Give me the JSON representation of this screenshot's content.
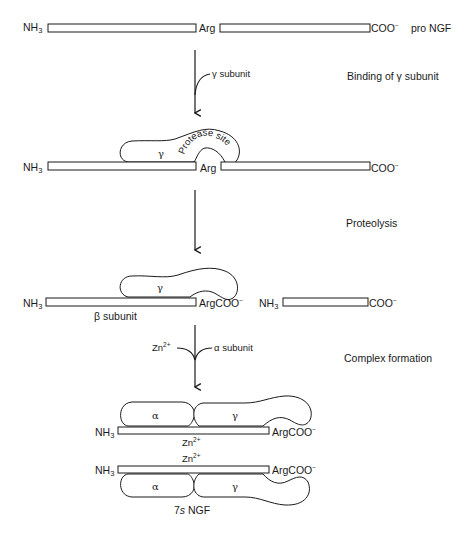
{
  "figure": {
    "stages": [
      {
        "id": "pro-ngf",
        "n_terminus": "NH3",
        "middle_label": "Arg",
        "c_terminus": "COO⁻",
        "name": "pro NGF"
      },
      {
        "id": "gamma-bound",
        "n_terminus": "NH3",
        "middle_label": "Arg",
        "c_terminus": "COO⁻",
        "gamma_label": "γ",
        "protease_label": "Protease site"
      },
      {
        "id": "cleaved",
        "left": {
          "n_terminus": "NH3",
          "c_terminus": "ArgCOO⁻",
          "name": "β subunit",
          "gamma_label": "γ"
        },
        "right": {
          "n_terminus": "NH3",
          "c_terminus": "COO⁻"
        }
      },
      {
        "id": "7s-ngf",
        "top": {
          "n_terminus": "NH3",
          "c_terminus": "ArgCOO⁻",
          "alpha_label": "α",
          "gamma_label": "γ",
          "ion": "Zn2+"
        },
        "bottom": {
          "n_terminus": "NH3",
          "c_terminus": "ArgCOO⁻",
          "alpha_label": "α",
          "gamma_label": "γ",
          "ion": "Zn2+"
        },
        "name": "7s NGF"
      }
    ],
    "steps": [
      {
        "input": "γ subunit",
        "description": "Binding of γ subunit"
      },
      {
        "description": "Proteolysis"
      },
      {
        "inputs": [
          "Zn2+",
          "α subunit"
        ],
        "description": "Complex formation"
      }
    ]
  },
  "text": {
    "nh3": "NH",
    "nh3_sub": "3",
    "arg": "Arg",
    "coo": "COO",
    "minus": "−",
    "argcoo": "ArgCOO",
    "pro_ngf": "pro NGF",
    "gamma": "γ",
    "alpha": "α",
    "gamma_subunit": "γ subunit",
    "alpha_subunit": "α subunit",
    "beta_subunit": "β subunit",
    "protease_site": "Protease site",
    "zn": "Zn",
    "zn_sup": "2+",
    "step1": "Binding of γ subunit",
    "step2": "Proteolysis",
    "step3": "Complex formation",
    "seven_s": "7",
    "s_italic": "s",
    "ngf": " NGF"
  }
}
